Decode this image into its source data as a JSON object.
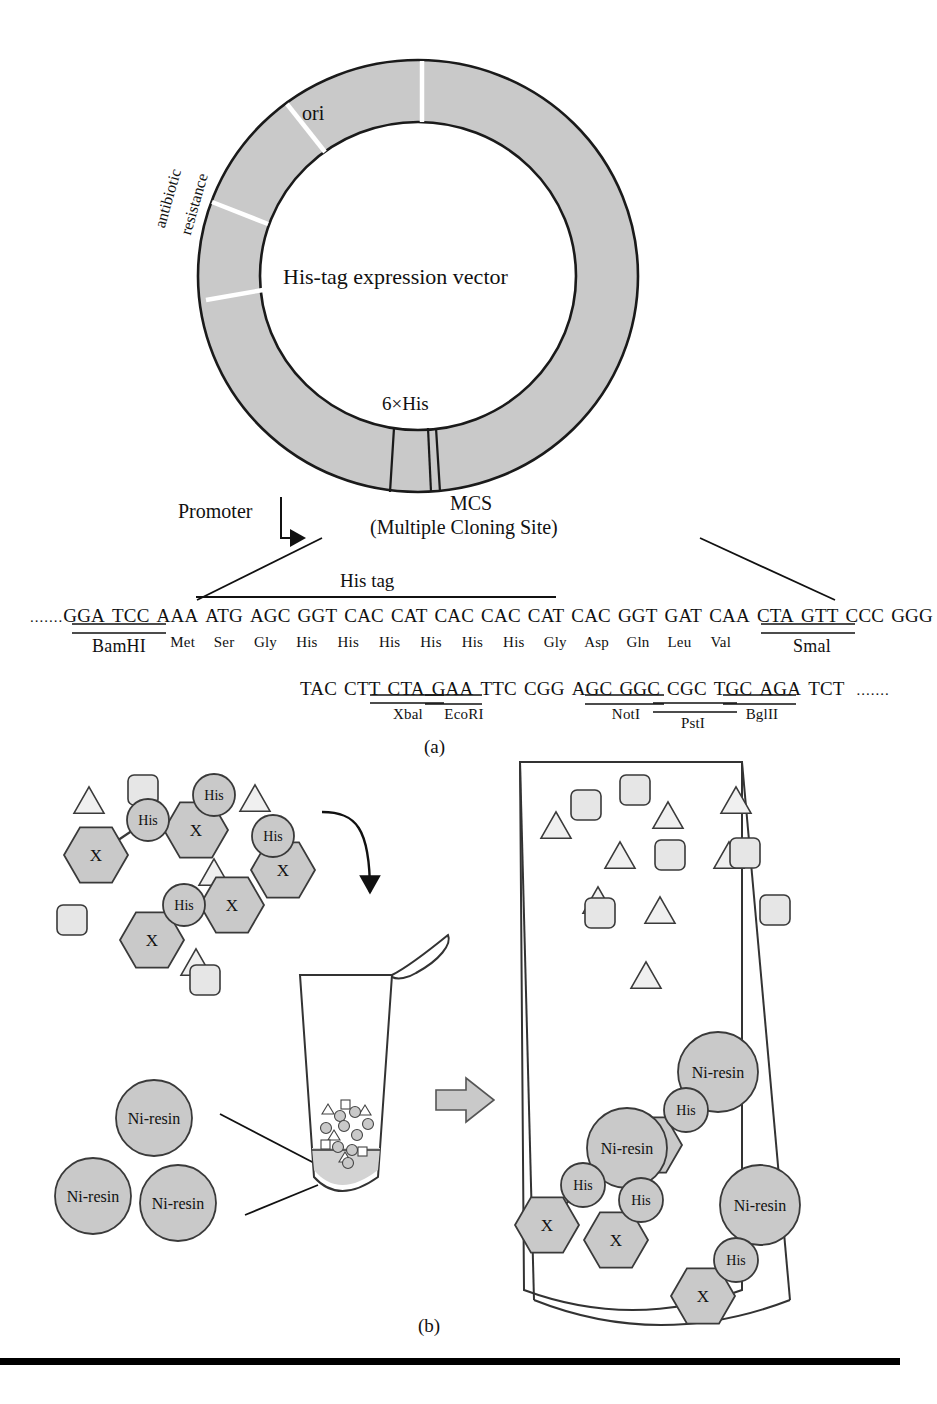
{
  "figure": {
    "panels": [
      {
        "id": "a",
        "label": "(a)"
      },
      {
        "id": "b",
        "label": "(b)"
      }
    ]
  },
  "plasmid": {
    "center_label": "His-tag expression vector",
    "features": [
      {
        "name": "ori",
        "label": "ori"
      },
      {
        "name": "antibiotic-resistance",
        "label_line1": "antibiotic",
        "label_line2": "resistance"
      },
      {
        "name": "his-tag-site",
        "label": "6×His"
      }
    ],
    "promoter_label": "Promoter",
    "mcs_label": "MCS",
    "mcs_sublabel": "(Multiple Cloning Site)",
    "fill_color": "#c9c9c9",
    "stroke_color": "#1a1a1a"
  },
  "sequence": {
    "his_tag_bracket_label": "His tag",
    "line1": {
      "prefix": ".......",
      "codons": [
        "GGA",
        "TCC",
        "AAA",
        "ATG",
        "AGC",
        "GGT",
        "CAC",
        "CAT",
        "CAC",
        "CAC",
        "CAT",
        "CAC",
        "GGT",
        "GAT",
        "CAA",
        "CTA",
        "GTT",
        "CCC",
        "GGG"
      ],
      "amino_acids": [
        "",
        "",
        "",
        "Met",
        "Ser",
        "Gly",
        "His",
        "His",
        "His",
        "His",
        "His",
        "His",
        "Gly",
        "Asp",
        "Gln",
        "Leu",
        "Val",
        "",
        ""
      ],
      "enzymes": [
        {
          "name": "BamHI",
          "label": "BamHI",
          "span_start": 1,
          "span_end": 2
        },
        {
          "name": "SmaI",
          "label": "Smal",
          "span_start": 17,
          "span_end": 18
        }
      ]
    },
    "line2": {
      "codons": [
        "TAC",
        "CTT",
        "CTA",
        "GAA",
        "TTC",
        "CGG",
        "AGC",
        "GGC",
        "CGC",
        "TGC",
        "AGA",
        "TCT"
      ],
      "suffix": ".......",
      "enzymes": [
        {
          "name": "XbaI",
          "label": "Xbal",
          "span_start": 1,
          "span_end": 3
        },
        {
          "name": "EcoRI",
          "label": "EcoRI",
          "span_start": 3,
          "span_end": 4
        },
        {
          "name": "NotI",
          "label": "NotI",
          "span_start": 6,
          "span_end": 8
        },
        {
          "name": "PstI",
          "label": "PstI",
          "span_start": 8,
          "span_end": 10
        },
        {
          "name": "BglII",
          "label": "BglII",
          "span_start": 10,
          "span_end": 11
        }
      ]
    }
  },
  "purification": {
    "his_label": "His",
    "protein_label": "X",
    "resin_label": "Ni-resin",
    "shapes": {
      "hexagon": "tagged-protein-hexagon",
      "circle": "his-tag-circle",
      "triangle": "contaminant-triangle",
      "square": "contaminant-square",
      "resin_circle": "ni-resin-bead"
    },
    "left_mixture": {
      "hexagons": [
        {
          "x": 96,
          "y": 855
        },
        {
          "x": 196,
          "y": 830
        },
        {
          "x": 232,
          "y": 905
        },
        {
          "x": 152,
          "y": 940
        },
        {
          "x": 283,
          "y": 870
        }
      ],
      "his_circles": [
        {
          "x": 148,
          "y": 820
        },
        {
          "x": 214,
          "y": 795
        },
        {
          "x": 273,
          "y": 836
        },
        {
          "x": 184,
          "y": 905
        }
      ],
      "triangles": [
        {
          "x": 89,
          "y": 800
        },
        {
          "x": 214,
          "y": 872
        },
        {
          "x": 255,
          "y": 798
        },
        {
          "x": 196,
          "y": 962
        }
      ],
      "squares": [
        {
          "x": 143,
          "y": 790
        },
        {
          "x": 72,
          "y": 920
        },
        {
          "x": 205,
          "y": 980
        }
      ]
    },
    "resin_pool": [
      {
        "x": 154,
        "y": 1118,
        "label": "Ni-resin"
      },
      {
        "x": 93,
        "y": 1196,
        "label": "Ni-resin"
      },
      {
        "x": 178,
        "y": 1203,
        "label": "Ni-resin"
      }
    ],
    "right_vessel": {
      "unbound_triangles": [
        {
          "x": 556,
          "y": 825
        },
        {
          "x": 620,
          "y": 855
        },
        {
          "x": 668,
          "y": 815
        },
        {
          "x": 736,
          "y": 800
        },
        {
          "x": 660,
          "y": 910
        },
        {
          "x": 729,
          "y": 855
        },
        {
          "x": 598,
          "y": 900
        },
        {
          "x": 646,
          "y": 975
        }
      ],
      "unbound_squares": [
        {
          "x": 586,
          "y": 805
        },
        {
          "x": 635,
          "y": 790
        },
        {
          "x": 670,
          "y": 855
        },
        {
          "x": 745,
          "y": 853
        },
        {
          "x": 600,
          "y": 913
        },
        {
          "x": 775,
          "y": 910
        }
      ],
      "complexes": [
        {
          "resin": {
            "x": 718,
            "y": 1072
          },
          "his": [
            {
              "x": 686,
              "y": 1110
            }
          ],
          "protein": [
            {
              "x": 650,
              "y": 1145
            }
          ]
        },
        {
          "resin": {
            "x": 627,
            "y": 1148
          },
          "his": [
            {
              "x": 583,
              "y": 1185
            },
            {
              "x": 641,
              "y": 1200
            }
          ],
          "protein": [
            {
              "x": 547,
              "y": 1225
            },
            {
              "x": 616,
              "y": 1240
            }
          ]
        },
        {
          "resin": {
            "x": 760,
            "y": 1205
          },
          "his": [
            {
              "x": 736,
              "y": 1260
            }
          ],
          "protein": [
            {
              "x": 703,
              "y": 1296
            }
          ]
        }
      ]
    }
  },
  "colors": {
    "gray_fill": "#c9c9c9",
    "light_fill": "#e2e2e2",
    "outline": "#3a3a3a",
    "rule": "#000000"
  }
}
